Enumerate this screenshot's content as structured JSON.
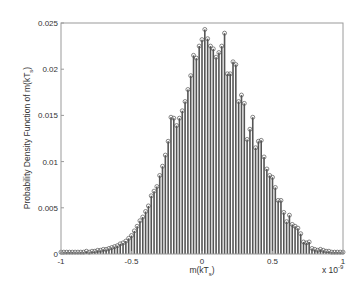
{
  "chart_data": {
    "type": "bar",
    "style": "stem",
    "title": "",
    "xlabel": "m(kT_s)",
    "ylabel": "Probability Density Function of m(kT_s)",
    "x_exponent_label": "x 10^-9",
    "xlim": [
      -1,
      1
    ],
    "ylim": [
      0,
      0.025
    ],
    "xticks": [
      "-1",
      "-0.5",
      "0",
      "0.5",
      "1"
    ],
    "yticks": [
      "0",
      "0.005",
      "0.01",
      "0.015",
      "0.02",
      "0.025"
    ],
    "grid": false,
    "legend": null,
    "x": [
      -1.0,
      -0.98,
      -0.96,
      -0.94,
      -0.92,
      -0.9,
      -0.88,
      -0.86,
      -0.84,
      -0.82,
      -0.8,
      -0.78,
      -0.76,
      -0.74,
      -0.72,
      -0.7,
      -0.68,
      -0.66,
      -0.64,
      -0.62,
      -0.6,
      -0.58,
      -0.56,
      -0.54,
      -0.52,
      -0.5,
      -0.48,
      -0.46,
      -0.44,
      -0.42,
      -0.4,
      -0.38,
      -0.36,
      -0.34,
      -0.32,
      -0.3,
      -0.28,
      -0.26,
      -0.24,
      -0.22,
      -0.2,
      -0.18,
      -0.16,
      -0.14,
      -0.12,
      -0.1,
      -0.08,
      -0.06,
      -0.04,
      -0.02,
      0.0,
      0.02,
      0.04,
      0.06,
      0.08,
      0.1,
      0.12,
      0.14,
      0.16,
      0.18,
      0.2,
      0.22,
      0.24,
      0.26,
      0.28,
      0.3,
      0.32,
      0.34,
      0.36,
      0.38,
      0.4,
      0.42,
      0.44,
      0.46,
      0.48,
      0.5,
      0.52,
      0.54,
      0.56,
      0.58,
      0.6,
      0.62,
      0.64,
      0.66,
      0.68,
      0.7,
      0.72,
      0.74,
      0.76,
      0.78,
      0.8,
      0.82,
      0.84,
      0.86,
      0.88,
      0.9,
      0.92,
      0.94,
      0.96,
      0.98,
      1.0
    ],
    "values": [
      0.0002,
      0.0002,
      0.0002,
      0.0002,
      0.0002,
      0.0002,
      0.0002,
      0.0002,
      0.0002,
      0.0003,
      0.0002,
      0.0003,
      0.0003,
      0.0004,
      0.0004,
      0.0005,
      0.0005,
      0.0006,
      0.0007,
      0.0008,
      0.0009,
      0.0011,
      0.0012,
      0.0014,
      0.0017,
      0.002,
      0.0025,
      0.003,
      0.0036,
      0.004,
      0.0046,
      0.0052,
      0.0063,
      0.0068,
      0.0073,
      0.0085,
      0.0095,
      0.0107,
      0.0122,
      0.0148,
      0.0147,
      0.0139,
      0.0147,
      0.0155,
      0.0165,
      0.0178,
      0.0193,
      0.0215,
      0.0212,
      0.0225,
      0.0232,
      0.0243,
      0.0233,
      0.0225,
      0.0222,
      0.0213,
      0.0218,
      0.0225,
      0.0239,
      0.0195,
      0.0195,
      0.0208,
      0.0205,
      0.0165,
      0.0172,
      0.0163,
      0.0124,
      0.0135,
      0.0148,
      0.0115,
      0.0122,
      0.0123,
      0.0105,
      0.0092,
      0.0085,
      0.0083,
      0.0072,
      0.0058,
      0.0058,
      0.0045,
      0.0035,
      0.0042,
      0.0032,
      0.003,
      0.0028,
      0.0022,
      0.0013,
      0.0012,
      0.0013,
      0.0006,
      0.0005,
      0.0004,
      0.0005,
      0.0004,
      0.0003,
      0.0003,
      0.0002,
      0.0002,
      0.0002,
      0.0002,
      0.0002
    ]
  },
  "axes": {
    "xlabel_main": "m(kT",
    "xlabel_sub": "s",
    "xlabel_end": ")",
    "ylabel_main": "Probability Density Function of m(kT",
    "ylabel_sub": "s",
    "ylabel_end": ")",
    "exp_base": "x 10",
    "exp_power": "-9"
  }
}
